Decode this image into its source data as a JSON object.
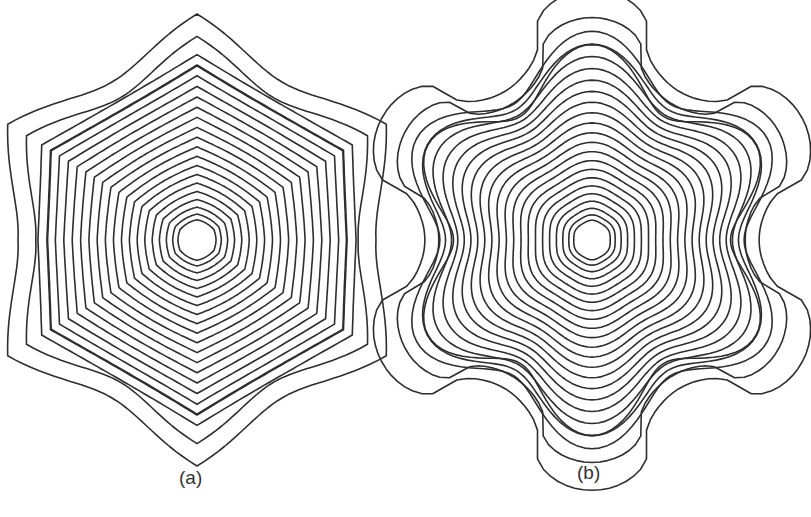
{
  "figure": {
    "panels": [
      {
        "id": "a",
        "label": "(a)",
        "description": "Concentric contour lines with hexagonal symmetry",
        "center": [
          197,
          240
        ],
        "contour_count": 22,
        "inner_radius": 20,
        "outer_radius": 205,
        "symmetry": 6,
        "shape": "hexagon"
      },
      {
        "id": "b",
        "label": "(b)",
        "description": "Concentric contour lines with six-lobed gear-shaped outer boundary",
        "center": [
          592,
          240
        ],
        "contour_count": 24,
        "inner_radius": 19,
        "outer_radius": 208,
        "symmetry": 6,
        "shape": "gear"
      }
    ]
  }
}
